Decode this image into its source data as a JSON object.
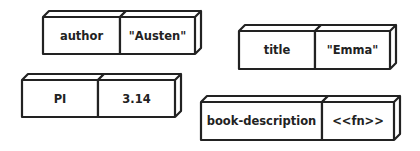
{
  "diagram": {
    "type": "key-value pairs",
    "stroke_color": "#222222",
    "background": "#ffffff",
    "pairs": [
      {
        "key": "author",
        "value": "\"Austen\"",
        "x": 43,
        "y": 17,
        "key_w": 77,
        "val_w": 75,
        "h": 37
      },
      {
        "key": "title",
        "value": "\"Emma\"",
        "x": 239,
        "y": 31,
        "key_w": 76,
        "val_w": 75,
        "h": 38
      },
      {
        "key": "PI",
        "value": "3.14",
        "x": 22,
        "y": 80,
        "key_w": 76,
        "val_w": 77,
        "h": 37
      },
      {
        "key": "book-description",
        "value": "<<fn>>",
        "x": 201,
        "y": 102,
        "key_w": 121,
        "val_w": 72,
        "h": 38
      }
    ]
  }
}
